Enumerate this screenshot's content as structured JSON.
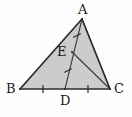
{
  "figure": {
    "kind": "geometry-diagram",
    "canvas": {
      "width": 132,
      "height": 117
    },
    "background_color": "#fdfdfd",
    "fill_color": "#cccccc",
    "stroke_color": "#2b2b2b",
    "tick_color": "#2b2b2b",
    "labels": [
      {
        "id": "A",
        "text": "A",
        "x": 78,
        "y": 3
      },
      {
        "id": "B",
        "text": "B",
        "x": 6,
        "y": 82
      },
      {
        "id": "C",
        "text": "C",
        "x": 114,
        "y": 82
      },
      {
        "id": "D",
        "text": "D",
        "x": 60,
        "y": 94
      },
      {
        "id": "E",
        "text": "E",
        "x": 57,
        "y": 45
      }
    ],
    "points": [
      {
        "id": "A",
        "x": 82,
        "y": 19
      },
      {
        "id": "B",
        "x": 20,
        "y": 89
      },
      {
        "id": "C",
        "x": 110,
        "y": 89
      },
      {
        "id": "D",
        "x": 65,
        "y": 89
      },
      {
        "id": "E",
        "x": 72,
        "y": 52
      }
    ],
    "triangle_path": "M 82 19 L 20 89 L 110 89 Z",
    "segments": [
      {
        "id": "AB",
        "from": "A",
        "to": "B"
      },
      {
        "id": "BC",
        "from": "B",
        "to": "C"
      },
      {
        "id": "CA",
        "from": "C",
        "to": "A"
      },
      {
        "id": "AD",
        "from": "A",
        "to": "D"
      },
      {
        "id": "EC",
        "from": "E",
        "to": "C"
      }
    ],
    "tick_marks": [
      {
        "id": "tick-BD",
        "on_segment": "BD",
        "x": 43,
        "y": 89,
        "angle": 90
      },
      {
        "id": "tick-DC",
        "on_segment": "DC",
        "x": 88,
        "y": 89,
        "angle": 90
      },
      {
        "id": "tick-AE",
        "on_segment": "AE",
        "x": 77,
        "y": 35,
        "angle": 77
      },
      {
        "id": "tick-ED",
        "on_segment": "ED",
        "x": 68,
        "y": 70,
        "angle": 77
      }
    ]
  }
}
